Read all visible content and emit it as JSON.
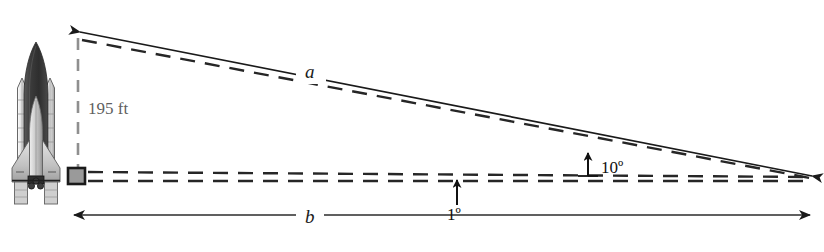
{
  "figure": {
    "background_color": "#ffffff"
  },
  "labels": {
    "height": "195 ft",
    "hypotenuse": "a",
    "base": "b",
    "angle_elevation": "10º",
    "angle_depression": "1º"
  },
  "colors": {
    "dimension_text": "#5f5f5f",
    "dimension_line": "#8a8a8a",
    "solid_line": "#1a1a1a",
    "dashed_line": "#262626",
    "shuttle_tank": "#3a3a3a",
    "shuttle_booster": "#d8d8d8",
    "shuttle_orbiter": "#bdbdbd",
    "marker_square_fill": "#9a9a9a",
    "marker_square_stroke": "#1a1a1a"
  },
  "icons": {
    "shuttle": "space-shuttle-icon",
    "arrow_left": "arrow-left-icon",
    "arrow_right": "arrow-right-icon",
    "arrow_up": "arrow-up-icon",
    "corner_marker": "right-angle-marker-icon"
  },
  "geometry": {
    "vertex_x": 78,
    "top_y": 38,
    "base_y": 176,
    "far_x": 812,
    "dimension_label_x": 88,
    "dimension_label_y": 100
  }
}
